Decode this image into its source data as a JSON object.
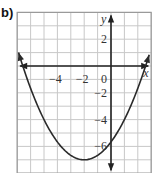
{
  "part_label": "b)",
  "colors": {
    "grid": "#c8c8c8",
    "border": "#9a9a9a",
    "axis": "#222222",
    "curve": "#2a2a2a",
    "text": "#333333"
  },
  "chart_data": {
    "type": "line",
    "title": "",
    "xlabel": "x",
    "ylabel": "y",
    "xlim": [
      -7,
      3
    ],
    "ylim": [
      -8,
      4
    ],
    "grid": true,
    "grid_step": 1,
    "x_tick_labels": [
      {
        "value": -4,
        "label": "−4"
      },
      {
        "value": -2,
        "label": "−2"
      },
      {
        "value": 0,
        "label": "0"
      }
    ],
    "y_tick_labels": [
      {
        "value": 2,
        "label": "2"
      },
      {
        "value": -2,
        "label": "−2"
      },
      {
        "value": -4,
        "label": "−4"
      },
      {
        "value": -6,
        "label": "−6"
      }
    ],
    "series": [
      {
        "name": "parabola",
        "equation_estimate": "y = (1/3)(x+2)^2 - 7",
        "vertex": [
          -2,
          -7
        ],
        "x_intercepts": [
          -6.6,
          2.6
        ],
        "y_intercept": -5.7,
        "x_range": [
          -6.9,
          2.85
        ],
        "arrows_both_ends": true
      }
    ],
    "axes_arrows": {
      "x": "both",
      "y": "both"
    }
  }
}
